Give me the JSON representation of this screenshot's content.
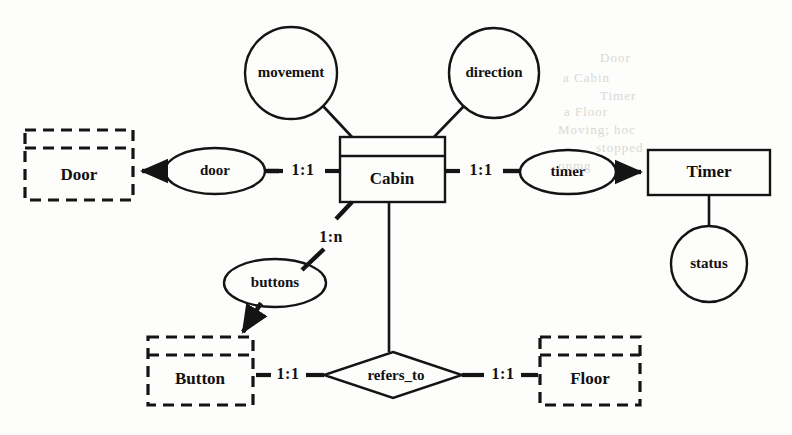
{
  "diagram": {
    "type": "entity-relationship",
    "background_color": "#fdfdfc",
    "line_color": "#141414",
    "entities": [
      {
        "id": "door",
        "label": "Door",
        "style": "dashed",
        "has_header_divider": true,
        "x": 25,
        "y": 130,
        "w": 108,
        "h": 70
      },
      {
        "id": "cabin",
        "label": "Cabin",
        "style": "solid",
        "has_header_divider": true,
        "x": 340,
        "y": 137,
        "w": 105,
        "h": 65
      },
      {
        "id": "timer",
        "label": "Timer",
        "style": "solid",
        "has_header_divider": false,
        "x": 648,
        "y": 150,
        "w": 122,
        "h": 45
      },
      {
        "id": "button",
        "label": "Button",
        "style": "dashed",
        "has_header_divider": true,
        "x": 148,
        "y": 337,
        "w": 105,
        "h": 68
      },
      {
        "id": "floor",
        "label": "Floor",
        "style": "dashed",
        "has_header_divider": true,
        "x": 540,
        "y": 337,
        "w": 100,
        "h": 68
      }
    ],
    "attributes": [
      {
        "id": "movement",
        "label": "movement",
        "shape": "circle",
        "cx": 291,
        "cy": 73,
        "r": 46
      },
      {
        "id": "direction",
        "label": "direction",
        "shape": "circle",
        "cx": 494,
        "cy": 73,
        "r": 45
      },
      {
        "id": "status",
        "label": "status",
        "shape": "circle",
        "cx": 709,
        "cy": 264,
        "r": 38
      },
      {
        "id": "door_rel",
        "label": "door",
        "shape": "ellipse",
        "cx": 215,
        "cy": 171,
        "rx": 50,
        "ry": 23
      },
      {
        "id": "timer_rel",
        "label": "timer",
        "shape": "ellipse",
        "cx": 568,
        "cy": 172,
        "rx": 48,
        "ry": 22
      },
      {
        "id": "buttons",
        "label": "buttons",
        "shape": "ellipse",
        "cx": 275,
        "cy": 283,
        "rx": 51,
        "ry": 24
      }
    ],
    "relationships": [
      {
        "id": "refers_to",
        "label": "refers_to",
        "shape": "diamond",
        "cx": 393,
        "cy": 375,
        "rx": 69,
        "ry": 23
      }
    ],
    "cardinalities": [
      {
        "id": "card-door",
        "label": "1:1",
        "x": 303,
        "y": 171
      },
      {
        "id": "card-timer",
        "label": "1:1",
        "x": 481,
        "y": 171
      },
      {
        "id": "card-buttons",
        "label": "1:n",
        "x": 331,
        "y": 238
      },
      {
        "id": "card-button",
        "label": "1:1",
        "x": 288,
        "y": 375
      },
      {
        "id": "card-floor",
        "label": "1:1",
        "x": 503,
        "y": 375
      }
    ],
    "bleed_artifacts": [
      {
        "text": "Door",
        "x": 600,
        "y": 58
      },
      {
        "text": "a Cabin",
        "x": 565,
        "y": 78
      },
      {
        "text": "Timer",
        "x": 600,
        "y": 96
      },
      {
        "text": "a Floor",
        "x": 566,
        "y": 112
      },
      {
        "text": "Moving; hoc",
        "x": 560,
        "y": 130
      },
      {
        "text": "stopped",
        "x": 596,
        "y": 148
      },
      {
        "text": "onmg",
        "x": 560,
        "y": 166
      }
    ]
  }
}
